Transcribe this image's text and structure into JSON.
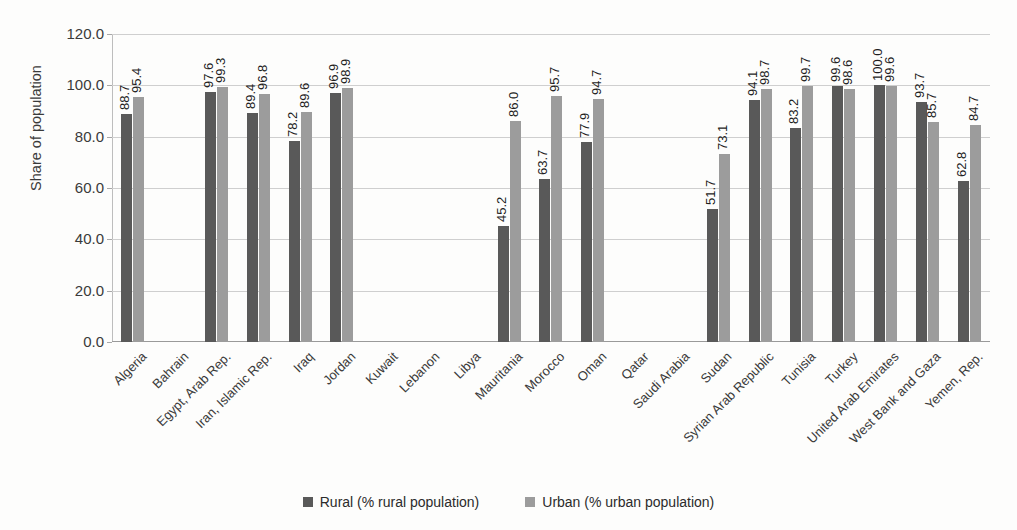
{
  "chart_data": {
    "type": "bar",
    "title": "",
    "xlabel": "",
    "ylabel": "Share of population",
    "ylim": [
      0,
      120
    ],
    "ytick_step": 20,
    "ytick_labels": [
      "0.0",
      "20.0",
      "40.0",
      "60.0",
      "80.0",
      "100.0",
      "120.0"
    ],
    "grid": true,
    "legend_position": "bottom",
    "categories": [
      "Algeria",
      "Bahrain",
      "Egypt, Arab Rep.",
      "Iran, Islamic Rep.",
      "Iraq",
      "Jordan",
      "Kuwait",
      "Lebanon",
      "Libya",
      "Mauritania",
      "Morocco",
      "Oman",
      "Qatar",
      "Saudi Arabia",
      "Sudan",
      "Syrian Arab Republic",
      "Tunisia",
      "Turkey",
      "United Arab Emirates",
      "West Bank and Gaza",
      "Yemen, Rep."
    ],
    "series": [
      {
        "name": "Rural (% rural population)",
        "color": "#595959",
        "values": [
          88.7,
          null,
          97.6,
          89.4,
          78.2,
          96.9,
          null,
          null,
          null,
          45.2,
          63.7,
          77.9,
          null,
          null,
          51.7,
          94.1,
          83.2,
          99.6,
          100.0,
          93.7,
          62.8
        ],
        "labels": [
          "88.7",
          "",
          "97.6",
          "89.4",
          "78.2",
          "96.9",
          "",
          "",
          "",
          "45.2",
          "63.7",
          "77.9",
          "",
          "",
          "51.7",
          "94.1",
          "83.2",
          "99.6",
          "100.0",
          "93.7",
          "62.8"
        ]
      },
      {
        "name": "Urban (% urban population)",
        "color": "#9c9c9c",
        "values": [
          95.4,
          null,
          99.3,
          96.8,
          89.6,
          98.9,
          null,
          null,
          null,
          86.0,
          95.7,
          94.7,
          null,
          null,
          73.1,
          98.7,
          99.7,
          98.6,
          99.6,
          85.7,
          84.7
        ],
        "labels": [
          "95.4",
          "",
          "99.3",
          "96.8",
          "89.6",
          "98.9",
          "",
          "",
          "",
          "86.0",
          "95.7",
          "94.7",
          "",
          "",
          "73.1",
          "98.7",
          "99.7",
          "98.6",
          "99.6",
          "85.7",
          "84.7"
        ]
      }
    ]
  },
  "legend": {
    "items": [
      {
        "label": "Rural (% rural population)",
        "color": "#595959"
      },
      {
        "label": "Urban (% urban population)",
        "color": "#9c9c9c"
      }
    ]
  }
}
